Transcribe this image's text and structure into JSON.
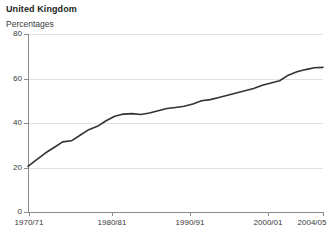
{
  "chart_data": {
    "type": "line",
    "title": "United Kingdom",
    "subtitle": "Percentages",
    "xlabel": "",
    "ylabel": "",
    "ylim": [
      0,
      80
    ],
    "yticks": [
      0,
      20,
      40,
      60,
      80
    ],
    "ytick_labels": [
      "0",
      "20",
      "40",
      "60",
      "80"
    ],
    "xticks": [
      1970,
      1980,
      1990,
      2000,
      2004
    ],
    "xtick_labels": [
      "1970/71",
      "1980/81",
      "1990/91",
      "2000/01",
      "2004/05"
    ],
    "grid": true,
    "legend": null,
    "line_color": "#333333",
    "x": [
      1970,
      1971,
      1972,
      1973,
      1974,
      1975,
      1976,
      1977,
      1978,
      1979,
      1980,
      1981,
      1982,
      1983,
      1984,
      1985,
      1986,
      1987,
      1988,
      1989,
      1990,
      1991,
      1992,
      1993,
      1994,
      1995,
      1996,
      1997,
      1998,
      1999,
      2000,
      2001,
      2002,
      2003,
      2004
    ],
    "values": [
      20.5,
      23.5,
      26.5,
      29.0,
      31.5,
      32.0,
      34.5,
      37.0,
      38.5,
      41.0,
      43.0,
      44.0,
      44.2,
      43.8,
      44.5,
      45.5,
      46.5,
      47.0,
      47.5,
      48.5,
      50.0,
      50.5,
      51.5,
      52.5,
      53.5,
      54.5,
      55.5,
      57.0,
      58.0,
      59.0,
      61.5,
      63.0,
      64.0,
      64.8,
      65.0
    ],
    "series": [
      {
        "name": "United Kingdom",
        "values": [
          20.5,
          23.5,
          26.5,
          29.0,
          31.5,
          32.0,
          34.5,
          37.0,
          38.5,
          41.0,
          43.0,
          44.0,
          44.2,
          43.8,
          44.5,
          45.5,
          46.5,
          47.0,
          47.5,
          48.5,
          50.0,
          50.5,
          51.5,
          52.5,
          53.5,
          54.5,
          55.5,
          57.0,
          58.0,
          59.0,
          61.5,
          63.0,
          64.0,
          64.8,
          65.0
        ]
      }
    ]
  },
  "axes": {
    "y_axis_name": "percentage-axis",
    "x_axis_name": "year-axis"
  }
}
